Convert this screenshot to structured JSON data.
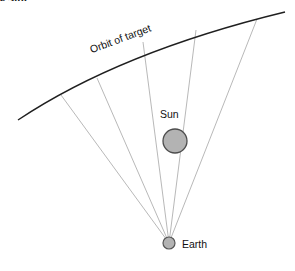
{
  "figure": {
    "clipped_caption": "e Sun",
    "background_color": "#ffffff",
    "width": 295,
    "height": 271
  },
  "labels": {
    "orbit": "Orbit of target",
    "sun": "Sun",
    "earth": "Earth"
  },
  "colors": {
    "orbit_stroke": "#1f1f1f",
    "ray_stroke": "#b0b0b0",
    "sun_fill": "#b3b3b3",
    "sun_stroke": "#4d4d4d",
    "earth_fill": "#b3b3b3",
    "earth_stroke": "#555555",
    "text": "#111111"
  },
  "geometry": {
    "earth": {
      "cx": 169,
      "cy": 243,
      "r": 6
    },
    "sun": {
      "cx": 175,
      "cy": 141,
      "r": 12
    },
    "orbit_path": "M 18 120 Q 120 52 285 12",
    "sight_lines": [
      {
        "x1": 169,
        "y1": 243,
        "x2": 61,
        "y2": 95
      },
      {
        "x1": 169,
        "y1": 243,
        "x2": 97,
        "y2": 78
      },
      {
        "x1": 169,
        "y1": 243,
        "x2": 143,
        "y2": 42
      },
      {
        "x1": 169,
        "y1": 243,
        "x2": 196,
        "y2": 30
      },
      {
        "x1": 169,
        "y1": 243,
        "x2": 257,
        "y2": 19
      }
    ],
    "orbit_label_rotation_deg": -20.5
  }
}
